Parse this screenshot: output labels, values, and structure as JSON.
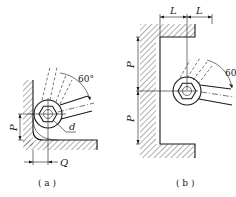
{
  "figure": {
    "panel_a": {
      "caption": "( a )",
      "angle_label": "60°",
      "dim_p": "P",
      "dim_q": "Q",
      "dim_d": "d"
    },
    "panel_b": {
      "caption": "( b )",
      "angle_label": "60°",
      "dim_l_left": "L",
      "dim_l_right": "L",
      "dim_p_top": "P",
      "dim_p_bottom": "P"
    }
  },
  "colors": {
    "line": "#1a1a1a",
    "background": "#ffffff"
  }
}
